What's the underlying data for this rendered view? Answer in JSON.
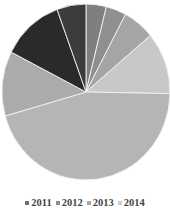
{
  "chart_data": {
    "type": "pie",
    "title": "",
    "center": [
      86,
      92
    ],
    "radius": [
      84,
      88
    ],
    "start_angle_deg": 0,
    "direction": "clockwise",
    "slices": [
      {
        "value": 3.9,
        "color": "#7f7f7f"
      },
      {
        "value": 3.9,
        "color": "#8f8f8f"
      },
      {
        "value": 6.1,
        "color": "#a5a5a5"
      },
      {
        "value": 11.4,
        "color": "#c8c8c8"
      },
      {
        "value": 45.3,
        "color": "#b5b5b5"
      },
      {
        "value": 11.9,
        "color": "#ababab"
      },
      {
        "value": 11.9,
        "color": "#2a2a2a"
      },
      {
        "value": 5.6,
        "color": "#3c3c3c"
      }
    ],
    "separator_color": "#f2f2f2",
    "legend": {
      "position": "bottom",
      "entries": [
        {
          "label": "2011",
          "color": "#6e6e6e"
        },
        {
          "label": "2012",
          "color": "#8c8c8c"
        },
        {
          "label": "2013",
          "color": "#a8a8a8"
        },
        {
          "label": "2014",
          "color": "#cccccc"
        }
      ]
    }
  }
}
